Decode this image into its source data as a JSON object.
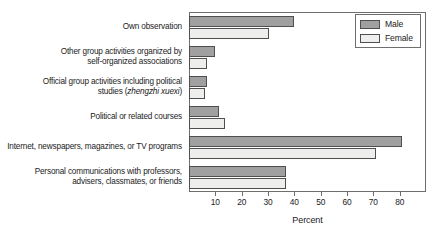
{
  "chart_data": {
    "type": "bar",
    "orientation": "horizontal",
    "title": "",
    "xlabel": "Percent",
    "ylabel": "",
    "xlim": [
      0,
      90
    ],
    "xticks": [
      10,
      20,
      30,
      40,
      50,
      60,
      70,
      80
    ],
    "xtick_labels": [
      "10",
      "20",
      "30",
      "40",
      "50",
      "60",
      "70",
      "80"
    ],
    "grid": false,
    "legend_position": "top-right",
    "categories": [
      "Own observation",
      "Other group activities organized by self-organized associations",
      "Official group activities including political studies (zhengzhi xuexi)",
      "Political or related courses",
      "Internet, newspapers, magazines, or TV programs",
      "Personal communications with professors, advisers, classmates, or friends"
    ],
    "category_lines": [
      [
        "Own observation"
      ],
      [
        "Other group activities organized by",
        "self-organized associations"
      ],
      [
        "Official group activities including political",
        "studies (zhengzhi xuexi)"
      ],
      [
        "Political or related courses"
      ],
      [
        "Internet, newspapers, magazines, or TV programs"
      ],
      [
        "Personal communications with professors,",
        "advisers, classmates, or friends"
      ]
    ],
    "italic_term": "zhengzhi xuexi",
    "series": [
      {
        "name": "Male",
        "color": "#a0a0a0",
        "values": [
          40,
          10,
          7,
          11.5,
          81,
          37
        ]
      },
      {
        "name": "Female",
        "color": "#eeeeec",
        "values": [
          30.5,
          7,
          6,
          13.5,
          71,
          37
        ]
      }
    ]
  },
  "legend": {
    "items": [
      {
        "label": "Male"
      },
      {
        "label": "Female"
      }
    ]
  },
  "colors": {
    "male": "#a0a0a0",
    "female": "#eeeeec",
    "bar_outline": "#4f4f4f",
    "frame": "#6e6e6e",
    "text": "#1b1b1b",
    "background": "#ffffff"
  }
}
